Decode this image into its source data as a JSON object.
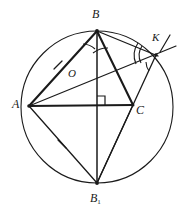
{
  "figure": {
    "background_color": "#ffffff",
    "stroke_color": "#1a1a1a",
    "labels": [
      {
        "id": "label-B",
        "text": "B",
        "sub": "",
        "x": 92,
        "y": 8,
        "size": "normal"
      },
      {
        "id": "label-K",
        "text": "K",
        "sub": "",
        "x": 152,
        "y": 32,
        "size": "small"
      },
      {
        "id": "label-O",
        "text": "O",
        "sub": "",
        "x": 68,
        "y": 68,
        "size": "small"
      },
      {
        "id": "label-A",
        "text": "A",
        "sub": "",
        "x": 12,
        "y": 98,
        "size": "normal"
      },
      {
        "id": "label-C",
        "text": "C",
        "sub": "",
        "x": 136,
        "y": 104,
        "size": "normal"
      },
      {
        "id": "label-B1",
        "text": "B",
        "sub": "1",
        "x": 90,
        "y": 192,
        "size": "normal"
      }
    ],
    "points": {
      "A": {
        "x": 29,
        "y": 106
      },
      "B": {
        "x": 97,
        "y": 31
      },
      "C": {
        "x": 133,
        "y": 105
      },
      "B1": {
        "x": 97,
        "y": 183
      },
      "O": {
        "x": 82,
        "y": 83
      },
      "K": {
        "x": 156,
        "y": 55
      },
      "H": {
        "x": 97,
        "y": 105
      }
    },
    "circle": {
      "cx": 97,
      "cy": 107,
      "r": 76
    },
    "segments": [
      {
        "name": "side-AB",
        "from": "A",
        "to": "B"
      },
      {
        "name": "side-AC",
        "from": "A",
        "to": "C"
      },
      {
        "name": "side-BC",
        "from": "B",
        "to": "C"
      },
      {
        "name": "altitude-BH",
        "from": "B",
        "to": "B1"
      },
      {
        "name": "chord-AB1",
        "from": "A",
        "to": "B1"
      },
      {
        "name": "chord-CB1",
        "from": "C",
        "to": "B1"
      },
      {
        "name": "segment-BK",
        "from": "B",
        "to": "K"
      },
      {
        "name": "segment-KB1",
        "from": "K",
        "to": "B1"
      },
      {
        "name": "line-AOK",
        "from": "A",
        "to": "K"
      }
    ],
    "tick_marks": [
      {
        "name": "tick-on-AB",
        "x": 58,
        "y": 65
      },
      {
        "name": "tick-on-AB1",
        "x": 62,
        "y": 144
      }
    ],
    "angle_marks": [
      {
        "name": "angle-arc-at-B-left",
        "vertex": "B"
      },
      {
        "name": "angle-arc-at-B-right",
        "vertex": "B"
      },
      {
        "name": "angle-arc-at-K-outer",
        "vertex": "K"
      },
      {
        "name": "angle-arc-at-K-inner",
        "vertex": "K"
      }
    ],
    "right_angle": {
      "name": "right-angle-at-foot",
      "x": 97,
      "y": 105,
      "size": 8
    }
  }
}
